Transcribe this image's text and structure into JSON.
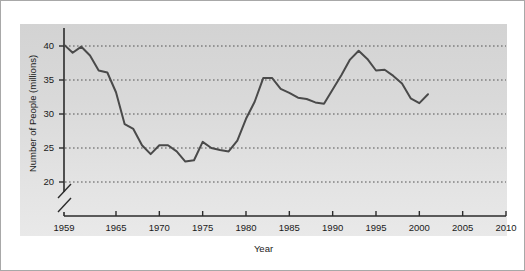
{
  "figure": {
    "background_color": "#ffffff",
    "panel_color": "#d9d9d9",
    "border_color": "#a8a8a8",
    "line_color": "#4a4a4a"
  },
  "chart_data": {
    "type": "line",
    "title": "",
    "subtitle": "",
    "xlabel": "Year",
    "ylabel": "Number of People (millions)",
    "xlim": [
      1959,
      2010
    ],
    "ylim": [
      18,
      41.5
    ],
    "y_axis_break": true,
    "y_axis_break_below": 20,
    "grid": true,
    "grid_style": "dotted-horizontal",
    "legend": "none",
    "xticks": [
      1959,
      1965,
      1970,
      1975,
      1980,
      1985,
      1990,
      1995,
      2000,
      2005,
      2010
    ],
    "xticklabels": [
      "1959",
      "1965",
      "1970",
      "1975",
      "1980",
      "1985",
      "1990",
      "1995",
      "2000",
      "2005",
      "2010"
    ],
    "yticks": [
      20,
      25,
      30,
      35,
      40
    ],
    "yticklabels": [
      "20",
      "25",
      "30",
      "35",
      "40"
    ],
    "series": [
      {
        "name": "Number of People",
        "x": [
          1959,
          1960,
          1961,
          1962,
          1963,
          1964,
          1965,
          1966,
          1967,
          1968,
          1969,
          1970,
          1971,
          1972,
          1973,
          1974,
          1975,
          1976,
          1977,
          1978,
          1979,
          1980,
          1981,
          1982,
          1983,
          1984,
          1985,
          1986,
          1987,
          1988,
          1989,
          1990,
          1991,
          1992,
          1993,
          1994,
          1995,
          1996,
          1997,
          1998,
          1999,
          2000,
          2001
        ],
        "values": [
          40.2,
          39.0,
          39.9,
          38.6,
          36.4,
          36.1,
          33.2,
          28.5,
          27.8,
          25.4,
          24.1,
          25.4,
          25.4,
          24.5,
          23.0,
          23.2,
          25.9,
          25.0,
          24.7,
          24.5,
          26.1,
          29.3,
          31.8,
          35.3,
          35.3,
          33.7,
          33.1,
          32.4,
          32.2,
          31.7,
          31.5,
          33.6,
          35.7,
          38.0,
          39.3,
          38.1,
          36.4,
          36.5,
          35.6,
          34.5,
          32.3,
          31.6,
          32.9
        ],
        "color": "#4a4a4a",
        "linewidth": 2
      }
    ],
    "data_note": "Series shows poverty-style population counts: starts near 40.2 million in 1959, drops to about 24 million around 1969-1974, rises to about 35 million in 1983, dips to about 31.5 million in 1989, peaks near 39.2 million in 1993, falls to about 30 million in 1999-2000, then rises to about 32.9 million in 2001."
  }
}
